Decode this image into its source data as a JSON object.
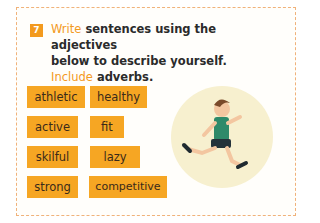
{
  "exercise": {
    "number": "7",
    "instruction_line1_highlight": "Write",
    "instruction_line1_rest": " sentences using the adjectives",
    "instruction_line2": "below to describe yourself.",
    "instruction_line3_highlight": "Include",
    "instruction_line3_rest": " adverbs."
  },
  "adjectives": [
    "athletic",
    "healthy",
    "active",
    "fit",
    "skilful",
    "lazy",
    "strong",
    "competitive"
  ],
  "illustration": "running-boy",
  "colors": {
    "accent": "#f39a1e",
    "word_box": "#f6a623",
    "circle": "#f7f0cf",
    "border": "#f0b27a"
  }
}
